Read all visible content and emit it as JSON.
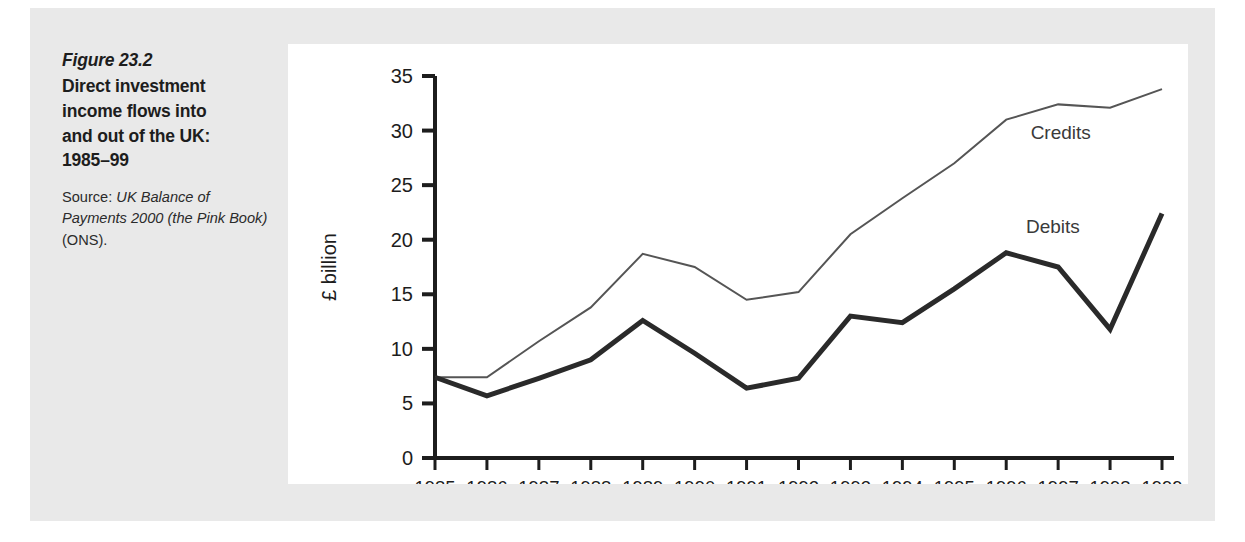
{
  "figure": {
    "number": "Figure 23.2",
    "title_lines": [
      "Direct investment",
      "income flows into",
      "and out of the UK:",
      "1985–99"
    ],
    "source_prefix": "Source: ",
    "source_italic_1": "UK Balance of",
    "source_italic_2": "Payments 2000 (the",
    "source_italic_3": "Pink Book)",
    "source_suffix": " (ONS)."
  },
  "colors": {
    "page_background": "#ffffff",
    "panel_background": "#e9e9e9",
    "plot_background": "#ffffff",
    "axis": "#1d1d1d",
    "credits_line": "#555555",
    "debits_line": "#2a2a2a",
    "text": "#1d1d1d"
  },
  "chart_data": {
    "type": "line",
    "title": "Direct investment income flows into and out of the UK: 1985–99",
    "xlabel": "",
    "ylabel": "£ billion",
    "x": [
      1985,
      1986,
      1987,
      1988,
      1989,
      1990,
      1991,
      1992,
      1993,
      1994,
      1995,
      1996,
      1997,
      1998,
      1999
    ],
    "categories": [
      "1985",
      "1986",
      "1987",
      "1988",
      "1989",
      "1990",
      "1991",
      "1992",
      "1993",
      "1994",
      "1995",
      "1996",
      "1997",
      "1998",
      "1999"
    ],
    "series": [
      {
        "name": "Credits",
        "color": "#555555",
        "line_width": 2,
        "values": [
          7.4,
          7.4,
          10.7,
          13.8,
          18.7,
          17.5,
          14.5,
          15.2,
          20.5,
          23.8,
          27.0,
          31.0,
          32.4,
          32.1,
          33.8
        ]
      },
      {
        "name": "Debits",
        "color": "#2a2a2a",
        "line_width": 5,
        "values": [
          7.4,
          5.7,
          7.3,
          9.0,
          12.6,
          9.6,
          6.4,
          7.3,
          13.0,
          12.4,
          15.5,
          18.8,
          17.5,
          11.8,
          22.4
        ]
      }
    ],
    "ylim": [
      0,
      35
    ],
    "yticks": [
      0,
      5,
      10,
      15,
      20,
      25,
      30,
      35
    ],
    "ytick_labels": [
      "0",
      "5",
      "10",
      "15",
      "20",
      "25",
      "30",
      "35"
    ],
    "xlim": [
      1985,
      1999
    ],
    "grid": false,
    "legend": "inline-annotations",
    "annotations": [
      {
        "text": "Credits",
        "x": 1997.05,
        "y": 29.2
      },
      {
        "text": "Debits",
        "x": 1996.9,
        "y": 20.6
      }
    ]
  }
}
